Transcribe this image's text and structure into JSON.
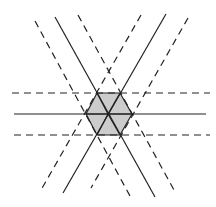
{
  "diagram": {
    "type": "geometric-hexagon-line-arrangement",
    "colors": {
      "fill": "#cccccc",
      "stroke": "#222222",
      "background": "#ffffff"
    },
    "hexagon": {
      "center": [
        108,
        114
      ],
      "vertices": [
        [
          97,
          93
        ],
        [
          120,
          93
        ],
        [
          132,
          114
        ],
        [
          120,
          135
        ],
        [
          97,
          135
        ],
        [
          86,
          114
        ]
      ]
    },
    "solid_lines": [
      {
        "x1": 14,
        "y1": 114,
        "x2": 206,
        "y2": 114
      },
      {
        "x1": 55,
        "y1": 17,
        "x2": 155,
        "y2": 197
      },
      {
        "x1": 166,
        "y1": 14,
        "x2": 63,
        "y2": 193
      }
    ],
    "dashed_lines": [
      {
        "x1": 12,
        "y1": 93,
        "x2": 210,
        "y2": 93
      },
      {
        "x1": 14,
        "y1": 135,
        "x2": 210,
        "y2": 135
      },
      {
        "x1": 35,
        "y1": 21,
        "x2": 130,
        "y2": 196
      },
      {
        "x1": 78,
        "y1": 15,
        "x2": 174,
        "y2": 190
      },
      {
        "x1": 141,
        "y1": 15,
        "x2": 41,
        "y2": 190
      },
      {
        "x1": 188,
        "y1": 18,
        "x2": 91,
        "y2": 188
      }
    ]
  }
}
